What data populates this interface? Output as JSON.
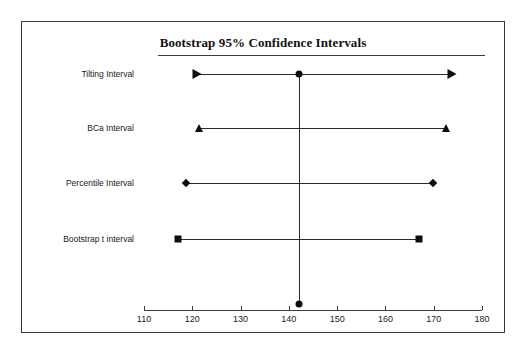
{
  "chart_data": {
    "type": "scatter",
    "title": "Bootstrap 95% Confidence Intervals",
    "xlabel": "",
    "ylabel": "",
    "xlim": [
      107,
      182
    ],
    "grid": false,
    "legend": "none",
    "x_ticks": [
      110,
      120,
      130,
      140,
      150,
      160,
      170,
      180
    ],
    "x_tick_labels": [
      "110",
      "120",
      "130",
      "140",
      "150",
      "160",
      "170",
      "180"
    ],
    "categories": [
      "Tilting Interval",
      "BCa Interval",
      "Percentile Interval",
      "Bootstrap t interval"
    ],
    "point_estimate": 142.0,
    "reference_line_value": 142.0,
    "intervals": [
      {
        "name": "Tilting Interval",
        "lower": 121.0,
        "upper": 173.8,
        "marker": "triangle-right",
        "center_marker": "circle",
        "center": 142.0
      },
      {
        "name": "BCa Interval",
        "lower": 121.4,
        "upper": 172.6,
        "marker": "triangle-up",
        "center_marker": "none",
        "center": null
      },
      {
        "name": "Percentile Interval",
        "lower": 118.8,
        "upper": 169.9,
        "marker": "diamond",
        "center_marker": "none",
        "center": null
      },
      {
        "name": "Bootstrap t interval",
        "lower": 117.1,
        "upper": 167.0,
        "marker": "square",
        "center_marker": "none",
        "center": null
      }
    ],
    "axis_dot": {
      "value": 142.0,
      "marker": "circle"
    },
    "colors": {
      "marker": "#0d0d0d",
      "line": "#2b2b2b",
      "axis": "#3d3d3d",
      "border": "#3a3a3a",
      "text": "#1a1a1a",
      "background": "#ffffff"
    }
  }
}
